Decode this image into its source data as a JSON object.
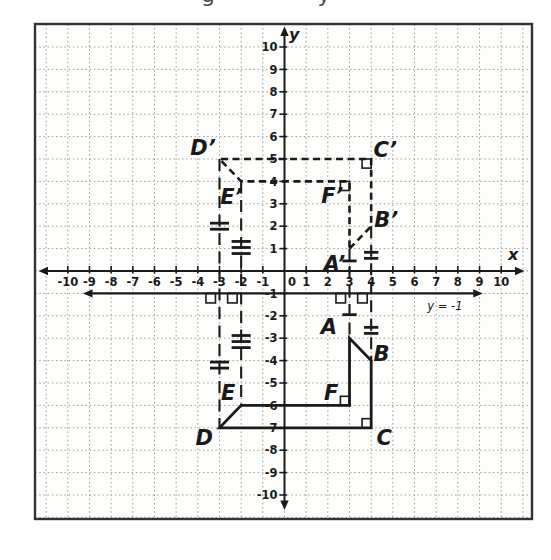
{
  "page": {
    "background": "#ffffff",
    "top_cropped_text": {
      "left_glyph": "g",
      "right_glyph": "y"
    }
  },
  "diagram": {
    "colors": {
      "ink": "#1a1a1a",
      "grid": "#a0a0a0",
      "frame": "#333333",
      "paper": "#fdfdfb"
    },
    "axes": {
      "x_label": "x",
      "y_label": "y",
      "origin_label": "0",
      "x_tick_labels": [
        "-10",
        "-9",
        "-8",
        "-7",
        "-6",
        "-5",
        "-4",
        "-3",
        "-2",
        "-1",
        "0",
        "1",
        "2",
        "3",
        "4",
        "5",
        "6",
        "7",
        "8",
        "9",
        "10"
      ],
      "y_tick_labels": [
        "10",
        "9",
        "8",
        "7",
        "6",
        "5",
        "4",
        "3",
        "2",
        "1",
        "-1",
        "-2",
        "-3",
        "-4",
        "-5",
        "-6",
        "-7",
        "-8",
        "-9",
        "-10"
      ]
    },
    "reflection_line": {
      "label": "y = -1",
      "y": -1,
      "x_from": -9.3,
      "x_to": 9.15,
      "label_pos": [
        7.4,
        -1.75
      ]
    },
    "solid_polygon": {
      "name": "ABCDEF",
      "vertices": [
        {
          "name": "A",
          "x": 3,
          "y": -3,
          "label_pos": [
            2.05,
            -2.5
          ]
        },
        {
          "name": "B",
          "x": 4,
          "y": -4,
          "label_pos": [
            4.48,
            -3.7
          ]
        },
        {
          "name": "C",
          "x": 4,
          "y": -7,
          "label_pos": [
            4.6,
            -7.45
          ]
        },
        {
          "name": "D",
          "x": -3,
          "y": -7,
          "label_pos": [
            -3.7,
            -7.45
          ]
        },
        {
          "name": "E",
          "x": -2,
          "y": -6,
          "label_pos": [
            -2.6,
            -5.45
          ]
        },
        {
          "name": "F",
          "x": 3,
          "y": -6,
          "label_pos": [
            2.15,
            -5.45
          ]
        }
      ]
    },
    "dashed_polygon": {
      "name": "A’B’C’D’E’F’",
      "vertices": [
        {
          "name": "A’",
          "x": 3,
          "y": 1,
          "label_pos": [
            2.3,
            0.3
          ]
        },
        {
          "name": "B’",
          "x": 4,
          "y": 2,
          "label_pos": [
            4.7,
            2.28
          ]
        },
        {
          "name": "C’",
          "x": 4,
          "y": 5,
          "label_pos": [
            4.65,
            5.4
          ]
        },
        {
          "name": "D’",
          "x": -3,
          "y": 5,
          "label_pos": [
            -3.76,
            5.5
          ]
        },
        {
          "name": "E’",
          "x": -2,
          "y": 4,
          "label_pos": [
            -2.45,
            3.3
          ]
        },
        {
          "name": "F’",
          "x": 3,
          "y": 4,
          "label_pos": [
            2.2,
            3.35
          ]
        }
      ]
    },
    "connectors": [
      {
        "x": -3,
        "y_from": 5,
        "y_to": -7,
        "ticks": 2,
        "tick_upper": 2.0,
        "tick_lower": -4.2,
        "tick_halflen": 0.44
      },
      {
        "x": -2,
        "y_from": 4,
        "y_to": -6,
        "ticks": 3,
        "tick_upper": 1.05,
        "tick_lower": -3.15,
        "tick_halflen": 0.44
      },
      {
        "x": 3,
        "y_from": 1,
        "y_to": -3,
        "ticks": 1,
        "tick_upper": 0.45,
        "tick_lower": -1.95,
        "tick_halflen": 0.33
      },
      {
        "x": 4,
        "y_from": 2,
        "y_to": -4,
        "ticks": 2,
        "tick_upper": 0.7,
        "tick_lower": -2.65,
        "tick_halflen": 0.33
      }
    ],
    "right_angle_marks_on_line": [
      {
        "x": -3
      },
      {
        "x": -2
      },
      {
        "x": 3
      },
      {
        "x": 4
      }
    ],
    "corner_right_angles": [
      {
        "vertex": "F",
        "x": 3,
        "y": -6,
        "dir": [
          -1,
          1
        ]
      },
      {
        "vertex": "C",
        "x": 4,
        "y": -7,
        "dir": [
          -1,
          1
        ]
      },
      {
        "vertex": "F’",
        "x": 3,
        "y": 4,
        "dir": [
          -1,
          -1
        ]
      },
      {
        "vertex": "C’",
        "x": 4,
        "y": 5,
        "dir": [
          -1,
          -1
        ]
      }
    ]
  },
  "chart_data": {
    "type": "line",
    "title": "",
    "xlabel": "x",
    "ylabel": "y",
    "xlim": [
      -10,
      10
    ],
    "ylim": [
      -10,
      10
    ],
    "grid": true,
    "series": [
      {
        "name": "polygon ABCDEF (solid preimage)",
        "closed": true,
        "style": "solid",
        "points": [
          [
            3,
            -3
          ],
          [
            4,
            -4
          ],
          [
            4,
            -7
          ],
          [
            -3,
            -7
          ],
          [
            -2,
            -6
          ],
          [
            3,
            -6
          ]
        ]
      },
      {
        "name": "polygon A'B'C'D'E'F' (dashed reflected image)",
        "closed": true,
        "style": "dashed",
        "points": [
          [
            3,
            1
          ],
          [
            4,
            2
          ],
          [
            4,
            5
          ],
          [
            -3,
            5
          ],
          [
            -2,
            4
          ],
          [
            3,
            4
          ]
        ]
      },
      {
        "name": "reflection line y = -1",
        "closed": false,
        "style": "solid",
        "points": [
          [
            -9.3,
            -1
          ],
          [
            9.15,
            -1
          ]
        ]
      }
    ]
  }
}
